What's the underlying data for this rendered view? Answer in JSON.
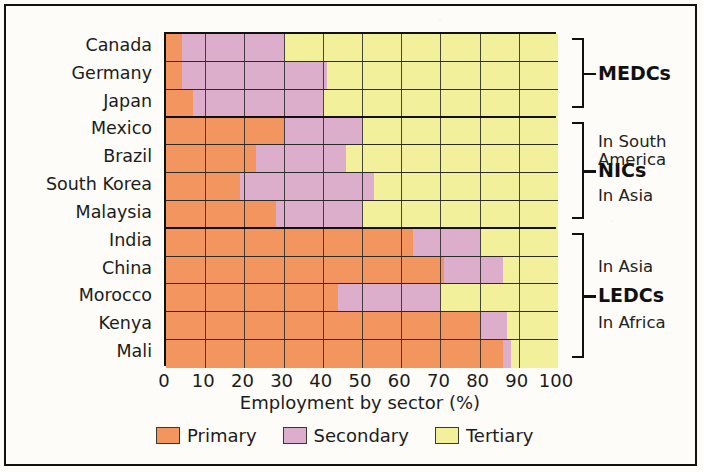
{
  "chart_data": {
    "type": "bar",
    "orientation": "horizontal",
    "stacked": true,
    "title": "",
    "xlabel": "Employment by sector (%)",
    "ylabel": "",
    "xlim": [
      0,
      100
    ],
    "xticks": [
      0,
      10,
      20,
      30,
      40,
      50,
      60,
      70,
      80,
      90,
      100
    ],
    "grid": true,
    "legend_position": "bottom",
    "legend": [
      {
        "name": "Primary",
        "color": "#f3955e"
      },
      {
        "name": "Secondary",
        "color": "#ddaecb"
      },
      {
        "name": "Tertiary",
        "color": "#f2f09a"
      }
    ],
    "categories": [
      "Canada",
      "Germany",
      "Japan",
      "Mexico",
      "Brazil",
      "South Korea",
      "Malaysia",
      "India",
      "China",
      "Morocco",
      "Kenya",
      "Mali"
    ],
    "series": [
      {
        "name": "Primary",
        "values": [
          4,
          4,
          7,
          30,
          23,
          19,
          28,
          63,
          71,
          44,
          80,
          86
        ]
      },
      {
        "name": "Secondary",
        "values": [
          26,
          37,
          33,
          20,
          23,
          34,
          22,
          17,
          15,
          26,
          7,
          2
        ]
      },
      {
        "name": "Tertiary",
        "values": [
          70,
          59,
          60,
          50,
          54,
          47,
          50,
          20,
          14,
          30,
          13,
          12
        ]
      }
    ],
    "groups": [
      {
        "label": "MEDCs",
        "categories": [
          "Canada",
          "Germany",
          "Japan"
        ],
        "notes": []
      },
      {
        "label": "NICs",
        "categories": [
          "Mexico",
          "Brazil",
          "South Korea",
          "Malaysia"
        ],
        "notes": [
          "In South America",
          "In Asia"
        ]
      },
      {
        "label": "LEDCs",
        "categories": [
          "India",
          "China",
          "Morocco",
          "Kenya",
          "Mali"
        ],
        "notes": [
          "In Asia",
          "In Africa"
        ]
      }
    ],
    "annotations": [
      {
        "text": "In South",
        "group": "NICs"
      },
      {
        "text": "America",
        "group": "NICs"
      },
      {
        "text": "In Asia",
        "group": "NICs"
      },
      {
        "text": "In Asia",
        "group": "LEDCs"
      },
      {
        "text": "In Africa",
        "group": "LEDCs"
      }
    ]
  }
}
